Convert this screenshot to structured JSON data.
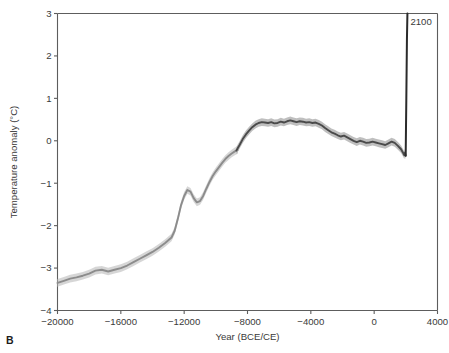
{
  "figure": {
    "panel_label": "B"
  },
  "chart_data": {
    "type": "line",
    "title": "",
    "xlabel": "Year (BCE/CE)",
    "ylabel": "Temperature anomaly (°C)",
    "xlim": [
      -20000,
      4000
    ],
    "ylim": [
      -4,
      3
    ],
    "xticks": [
      -20000,
      -16000,
      -12000,
      -8000,
      -4000,
      0,
      4000
    ],
    "xticklabels": [
      "−20000",
      "−16000",
      "−12000",
      "−8000",
      "−4000",
      "0",
      "4000"
    ],
    "yticks": [
      -4,
      -3,
      -2,
      -1,
      0,
      1,
      2,
      3
    ],
    "yticklabels": [
      "−4",
      "−3",
      "−2",
      "−1",
      "0",
      "1",
      "2",
      "3"
    ],
    "grid": false,
    "legend": "none",
    "annotations": [
      {
        "text": "2100",
        "x": 2100,
        "y": 2.72,
        "anchor": "start"
      }
    ],
    "colors": {
      "reconstruction_line": "#8c8c8c",
      "reconstruction_band": "#cfcfcf",
      "instrumental_line": "#4a4a4a",
      "instrumental_band": "#b4b4b4",
      "projection_line": "#2b2b2b",
      "axis": "#5d5d5d",
      "text": "#3a3a3a",
      "background": "#ffffff"
    },
    "series": [
      {
        "name": "Paleoclimate reconstruction (light grey)",
        "style": "line-with-uncertainty-band",
        "color": "#8c8c8c",
        "band_color": "#cfcfcf",
        "band_halfwidth": 0.09,
        "x": [
          -20000,
          -19600,
          -19200,
          -18800,
          -18400,
          -18000,
          -17600,
          -17200,
          -16800,
          -16400,
          -16000,
          -15600,
          -15200,
          -14800,
          -14400,
          -14000,
          -13600,
          -13200,
          -12800,
          -12600,
          -12400,
          -12200,
          -12000,
          -11800,
          -11600,
          -11400,
          -11200,
          -11000,
          -10800,
          -10600,
          -10400,
          -10200,
          -10000,
          -9800,
          -9600,
          -9400,
          -9200,
          -9000,
          -8800,
          -8600
        ],
        "y": [
          -3.35,
          -3.3,
          -3.25,
          -3.22,
          -3.18,
          -3.13,
          -3.06,
          -3.04,
          -3.08,
          -3.04,
          -3.0,
          -2.94,
          -2.86,
          -2.78,
          -2.7,
          -2.62,
          -2.52,
          -2.41,
          -2.28,
          -2.12,
          -1.84,
          -1.52,
          -1.3,
          -1.16,
          -1.2,
          -1.35,
          -1.45,
          -1.42,
          -1.3,
          -1.13,
          -0.97,
          -0.83,
          -0.72,
          -0.62,
          -0.52,
          -0.43,
          -0.36,
          -0.3,
          -0.25,
          -0.21
        ]
      },
      {
        "name": "Holocene reconstruction (dark grey)",
        "style": "line-with-uncertainty-band",
        "color": "#4a4a4a",
        "band_color": "#b4b4b4",
        "band_halfwidth": 0.09,
        "x": [
          -8700,
          -8500,
          -8300,
          -8100,
          -7900,
          -7700,
          -7500,
          -7300,
          -7100,
          -6900,
          -6700,
          -6500,
          -6300,
          -6100,
          -5900,
          -5700,
          -5500,
          -5300,
          -5100,
          -4900,
          -4700,
          -4500,
          -4300,
          -4100,
          -3900,
          -3700,
          -3500,
          -3300,
          -3100,
          -2900,
          -2700,
          -2500,
          -2300,
          -2100,
          -1900,
          -1700,
          -1500,
          -1300,
          -1100,
          -900,
          -700,
          -500,
          -300,
          -100,
          100,
          300,
          500,
          700,
          900,
          1100,
          1300,
          1500,
          1700,
          1850,
          1900,
          1950,
          1990
        ],
        "y": [
          -0.23,
          -0.1,
          0.04,
          0.15,
          0.24,
          0.32,
          0.38,
          0.42,
          0.44,
          0.43,
          0.42,
          0.44,
          0.41,
          0.42,
          0.45,
          0.43,
          0.46,
          0.48,
          0.46,
          0.44,
          0.46,
          0.45,
          0.43,
          0.44,
          0.42,
          0.43,
          0.4,
          0.36,
          0.3,
          0.25,
          0.2,
          0.17,
          0.13,
          0.1,
          0.12,
          0.08,
          0.04,
          0.0,
          -0.03,
          0.0,
          -0.02,
          -0.05,
          -0.04,
          -0.02,
          -0.04,
          -0.06,
          -0.08,
          -0.1,
          -0.06,
          -0.02,
          -0.05,
          -0.12,
          -0.2,
          -0.3,
          -0.34,
          -0.28,
          -0.35
        ]
      },
      {
        "name": "Future projection spike to 2100",
        "style": "line",
        "color": "#2b2b2b",
        "x": [
          1990,
          2010,
          2030,
          2050,
          2070,
          2100
        ],
        "y": [
          -0.35,
          0.3,
          0.95,
          1.7,
          2.4,
          3.0
        ]
      }
    ]
  }
}
